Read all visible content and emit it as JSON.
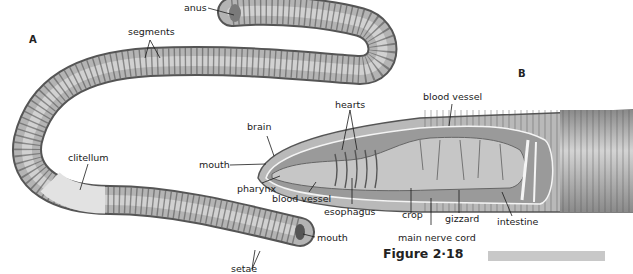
{
  "figure": {
    "caption": "Figure 2·18",
    "panels": [
      {
        "id": "A",
        "subject": "earthworm external anatomy"
      },
      {
        "id": "B",
        "subject": "earthworm internal anatomy (cutaway)"
      }
    ]
  },
  "panel_a": {
    "letter": "A",
    "labels": {
      "anus": "anus",
      "segments": "segments",
      "clitellum": "clitellum",
      "mouth": "mouth",
      "setae": "setae"
    }
  },
  "panel_b": {
    "letter": "B",
    "labels": {
      "brain": "brain",
      "hearts": "hearts",
      "blood_vessel_top": "blood vessel",
      "mouth": "mouth",
      "pharynx": "pharynx",
      "blood_vessel_bottom": "blood vessel",
      "esophagus": "esophagus",
      "crop": "crop",
      "main_nerve_cord": "main nerve cord",
      "gizzard": "gizzard",
      "intestine": "intestine"
    }
  },
  "colors": {
    "worm_body": "#a8a8a8",
    "worm_light": "#d9d9d9",
    "worm_dark": "#5a5a5a",
    "clitellum": "#dcdcdc",
    "caption_bar": "#c8c8c8",
    "text": "#1a1a1a"
  }
}
